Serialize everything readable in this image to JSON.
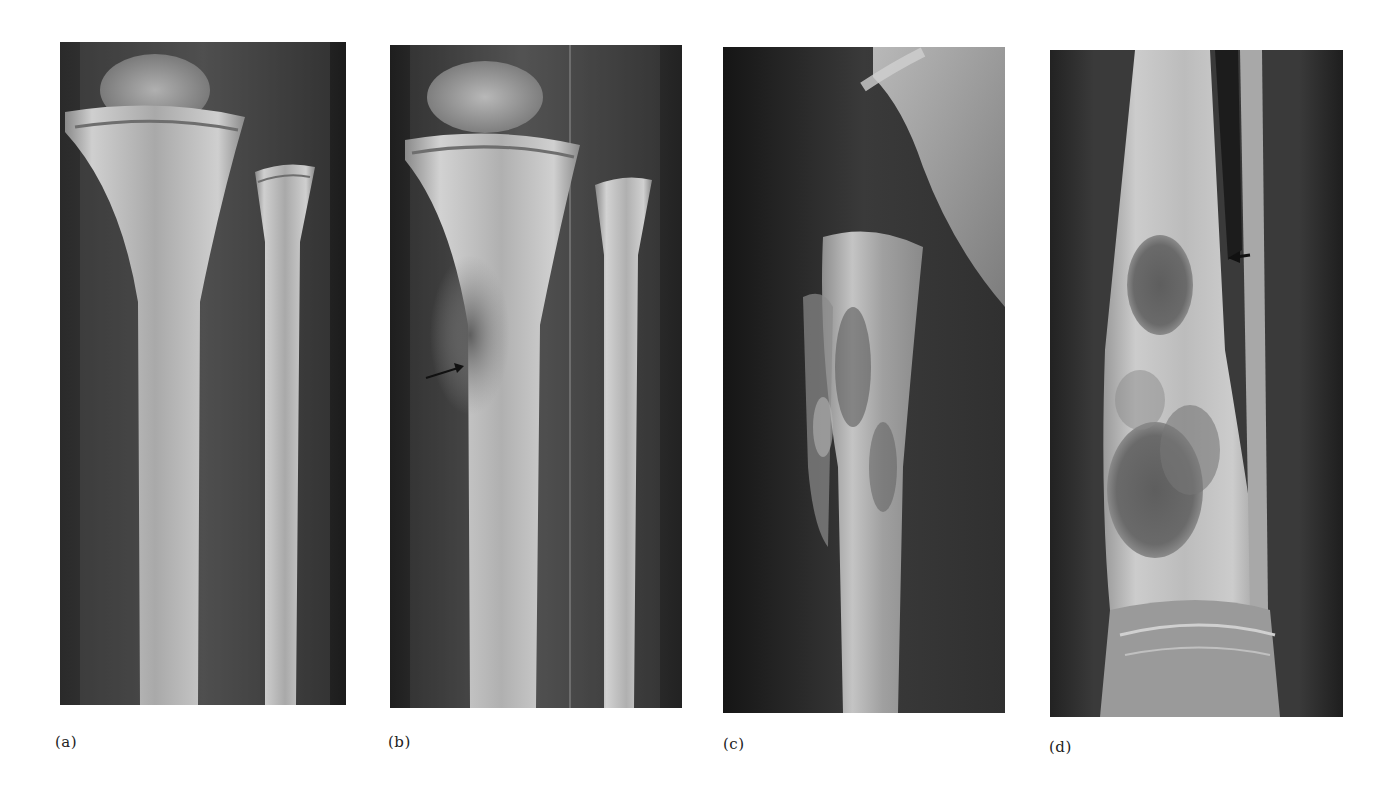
{
  "figure": {
    "panels": [
      {
        "id": "a",
        "label": "(a)",
        "content": "Radiograph of knee and lower leg, tibia and fibula (AP view), normal appearance",
        "annotations": []
      },
      {
        "id": "b",
        "label": "(b)",
        "content": "Radiograph of knee and lower leg, tibia and fibula (AP view) with lesion in proximal tibia",
        "annotations": [
          {
            "type": "arrow",
            "direction": "pointing right/up",
            "color": "#111111"
          }
        ]
      },
      {
        "id": "c",
        "label": "(c)",
        "content": "Lateral radiograph of long bone with mottled, irregular cortex and periosteal reaction",
        "annotations": []
      },
      {
        "id": "d",
        "label": "(d)",
        "content": "Radiograph of distal tibia/fibula with multiple lucent cystic lesions above the ankle",
        "annotations": [
          {
            "type": "arrow",
            "direction": "pointing left",
            "color": "#111111"
          }
        ]
      }
    ]
  },
  "colors": {
    "background": "#ffffff",
    "film_dark": "#1a1a1a",
    "bone_light": "#c8c8c8",
    "label_text": "#222222"
  }
}
